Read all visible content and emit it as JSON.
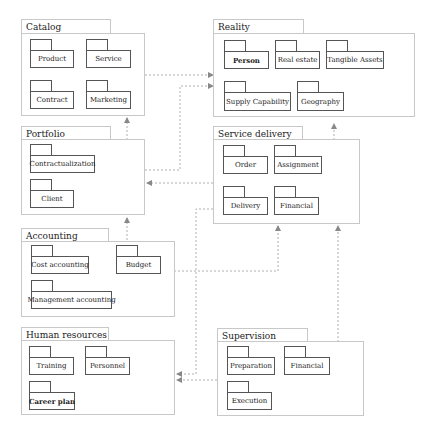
{
  "diagram": {
    "type": "UML package diagram",
    "packages": [
      {
        "id": "catalog",
        "label": "Catalog",
        "children": [
          "Product",
          "Service",
          "Contract",
          "Marketing"
        ]
      },
      {
        "id": "reality",
        "label": "Reality",
        "children": [
          "Person",
          "Real estate",
          "Tangible Assets",
          "Supply Capability",
          "Geography"
        ]
      },
      {
        "id": "portfolio",
        "label": "Portfolio",
        "children": [
          "Contractualization",
          "Client"
        ]
      },
      {
        "id": "service_delivery",
        "label": "Service delivery",
        "children": [
          "Order",
          "Assignment",
          "Delivery",
          "Financial"
        ]
      },
      {
        "id": "accounting",
        "label": "Accounting",
        "children": [
          "Cost accounting",
          "Budget",
          "Management accounting"
        ]
      },
      {
        "id": "human_resources",
        "label": "Human resources",
        "children": [
          "Training",
          "Personnel",
          "Career plan"
        ]
      },
      {
        "id": "supervision",
        "label": "Supervision",
        "children": [
          "Preparation",
          "Financial",
          "Execution"
        ]
      }
    ],
    "dependencies": [
      {
        "from": "catalog",
        "to": "reality"
      },
      {
        "from": "portfolio",
        "to": "reality"
      },
      {
        "from": "portfolio",
        "to": "catalog"
      },
      {
        "from": "service_delivery",
        "to": "reality"
      },
      {
        "from": "service_delivery",
        "to": "portfolio"
      },
      {
        "from": "accounting",
        "to": "portfolio"
      },
      {
        "from": "accounting",
        "to": "service_delivery"
      },
      {
        "from": "supervision",
        "to": "service_delivery"
      },
      {
        "from": "supervision",
        "to": "human_resources"
      },
      {
        "from": "service_delivery",
        "to": "human_resources"
      }
    ],
    "line_color": "#b0b0b0",
    "box_border_color": "#555555"
  }
}
